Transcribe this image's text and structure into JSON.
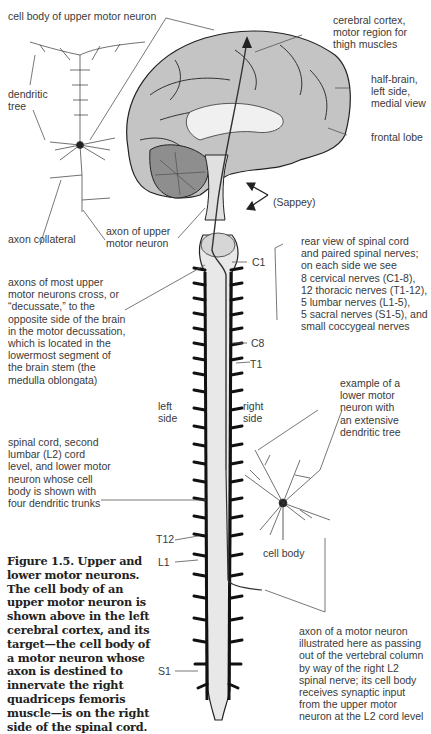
{
  "figure": {
    "caption": "Figure 1.5. Upper and\nlower motor neurons.\nThe cell body of an\nupper motor neuron is\nshown above in the left\ncerebral cortex, and its\ntarget—the cell body of\na motor neuron whose\naxon is destined to\ninnervate the right\nquadriceps femoris\nmuscle—is on the right\nside of the spinal cord."
  },
  "labels": {
    "cell_body_upper": "cell body of upper motor neuron",
    "dendritic_tree": "dendritic\ntree",
    "cerebral_cortex": "cerebral cortex,\nmotor region for\nthigh muscles",
    "half_brain": "half-brain,\nleft side,\nmedial view",
    "frontal_lobe": "frontal lobe",
    "sappey": "(Sappey)",
    "axon_collateral": "axon collateral",
    "axon_upper": "axon of upper\nmotor neuron",
    "rear_view": "rear view of spinal cord\nand paired spinal nerves;\non each side we see\n8 cervical nerves (C1-8),\n12 thoracic nerves (T1-12),\n5 lumbar nerves (L1-5),\n5 sacral nerves (S1-5), and\nsmall coccygeal nerves",
    "decussate": "axons of most upper\nmotor neurons cross, or\n“decussate,” to the\nopposite side of the brain\nin the motor decussation,\nwhich is located in the\nlowermost segment of\nthe brain stem (the\nmedulla oblongata)",
    "left_side": "left\nside",
    "right_side": "right\nside",
    "example_lower": "example of a\nlower motor\nneuron with\nan extensive\ndendritic tree",
    "spinal_l2": "spinal cord, second\nlumbar (L2) cord\nlevel, and lower motor\nneuron whose cell\nbody is shown with\nfour dendritic trunks",
    "cell_body": "cell body",
    "axon_motor": "axon of a motor neuron\nillustrated here as passing\nout of the vertebral column\nby way of the right L2\nspinal nerve; its cell body\nreceives synaptic input\nfrom the upper motor\nneuron at the L2 cord level"
  },
  "levels": {
    "c1": "C1",
    "c8": "C8",
    "t1": "T1",
    "t12": "T12",
    "l1": "L1",
    "s1": "S1"
  },
  "colors": {
    "ink": "#222222",
    "brain_fill": "#bdbdbd",
    "cord_fill": "#e8e8e8",
    "leader": "#555555"
  }
}
